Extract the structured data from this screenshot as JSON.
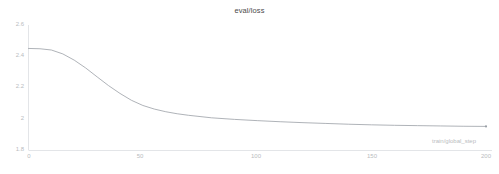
{
  "chart_data": {
    "type": "line",
    "title": "eval/loss",
    "xlabel": "train/global_step",
    "ylabel": "",
    "xlim": [
      0,
      200
    ],
    "ylim": [
      1.8,
      2.6
    ],
    "grid": false,
    "legend": false,
    "line_color": "#9aa0a6",
    "axis_color": "#e3e5e8",
    "tick_label_color": "#b9bcc0",
    "title_color": "#4a4a4a",
    "xticks": [
      0,
      50,
      100,
      150,
      200
    ],
    "xtick_labels": [
      "0",
      "50",
      "100",
      "150",
      "200"
    ],
    "yticks": [
      1.8,
      2.0,
      2.2,
      2.4,
      2.6
    ],
    "ytick_labels": [
      "1.8",
      "2",
      "2.2",
      "2.4",
      "2.6"
    ],
    "series": [
      {
        "name": "eval/loss",
        "x": [
          0,
          5,
          10,
          15,
          20,
          25,
          30,
          35,
          40,
          45,
          50,
          55,
          60,
          65,
          70,
          80,
          90,
          100,
          110,
          120,
          130,
          140,
          150,
          160,
          170,
          180,
          190,
          200
        ],
        "values": [
          2.45,
          2.448,
          2.44,
          2.415,
          2.375,
          2.325,
          2.268,
          2.212,
          2.162,
          2.118,
          2.085,
          2.062,
          2.045,
          2.032,
          2.022,
          2.006,
          1.996,
          1.988,
          1.981,
          1.975,
          1.97,
          1.965,
          1.961,
          1.958,
          1.956,
          1.954,
          1.952,
          1.951
        ]
      }
    ],
    "endpoint_marker": {
      "x": 200,
      "y": 1.951
    }
  }
}
